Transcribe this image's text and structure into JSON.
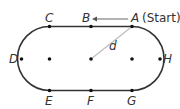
{
  "diagram": {
    "track_color": "#333333",
    "radius_line_color": "#bbbbbb",
    "points": {
      "A": {
        "label": "A",
        "suffix": "(Start)"
      },
      "B": {
        "label": "B"
      },
      "C": {
        "label": "C"
      },
      "D": {
        "label": "D"
      },
      "E": {
        "label": "E"
      },
      "F": {
        "label": "F"
      },
      "G": {
        "label": "G"
      },
      "H": {
        "label": "H"
      }
    },
    "distance_label": "d",
    "arrow": {
      "from": "A",
      "to": "B"
    }
  }
}
